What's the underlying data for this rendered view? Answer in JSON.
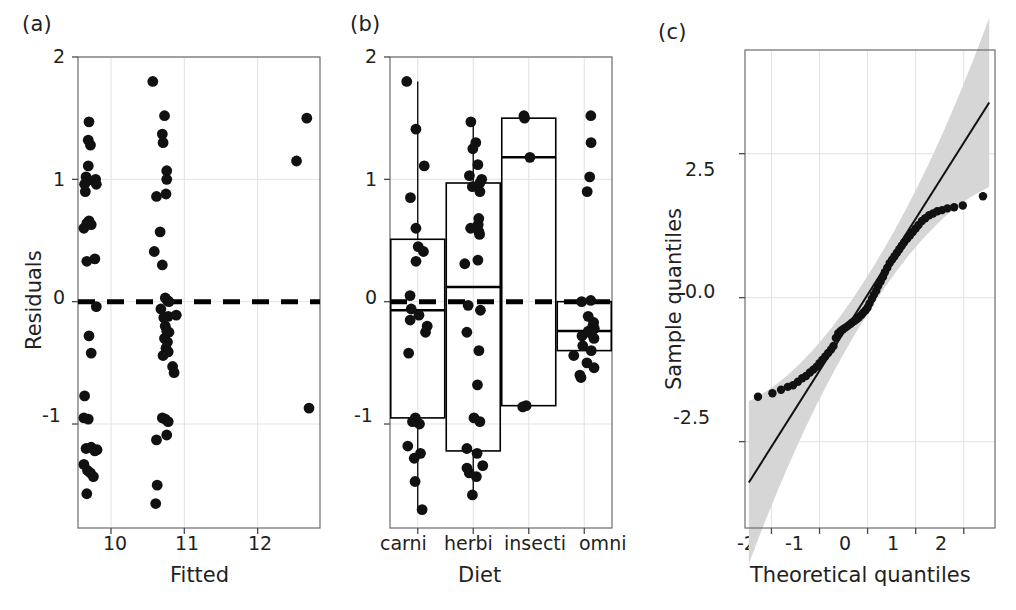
{
  "figure": {
    "panels": [
      {
        "id": "a",
        "label": "(a)"
      },
      {
        "id": "b",
        "label": "(b)"
      },
      {
        "id": "c",
        "label": "(c)"
      }
    ]
  },
  "chart_data": [
    {
      "type": "scatter",
      "panel": "(a)",
      "title": "",
      "xlabel": "Fitted",
      "ylabel": "Residuals",
      "xlim": [
        9.55,
        12.85
      ],
      "ylim": [
        -1.85,
        2.0
      ],
      "xticks": [
        10,
        11,
        12
      ],
      "xtick_labels": [
        "10",
        "11",
        "12"
      ],
      "yticks": [
        2,
        1,
        0,
        -1
      ],
      "ytick_labels": [
        "2",
        "1",
        "0",
        "-1"
      ],
      "grid": true,
      "reference_line": {
        "type": "horizontal",
        "y": 0,
        "style": "dashed"
      },
      "points": [
        {
          "x": 9.7,
          "y": 1.47
        },
        {
          "x": 9.69,
          "y": 1.32
        },
        {
          "x": 9.72,
          "y": 1.28
        },
        {
          "x": 9.69,
          "y": 1.11
        },
        {
          "x": 9.66,
          "y": 1.02
        },
        {
          "x": 9.68,
          "y": 0.99
        },
        {
          "x": 9.64,
          "y": 0.96
        },
        {
          "x": 9.79,
          "y": 1.0
        },
        {
          "x": 9.8,
          "y": 0.96
        },
        {
          "x": 9.65,
          "y": 0.9
        },
        {
          "x": 9.67,
          "y": 0.64
        },
        {
          "x": 9.7,
          "y": 0.66
        },
        {
          "x": 9.73,
          "y": 0.63
        },
        {
          "x": 9.63,
          "y": 0.6
        },
        {
          "x": 9.67,
          "y": 0.33
        },
        {
          "x": 9.78,
          "y": 0.35
        },
        {
          "x": 9.8,
          "y": -0.04
        },
        {
          "x": 9.7,
          "y": -0.28
        },
        {
          "x": 9.73,
          "y": -0.42
        },
        {
          "x": 9.64,
          "y": -0.77
        },
        {
          "x": 9.63,
          "y": -0.95
        },
        {
          "x": 9.69,
          "y": -0.96
        },
        {
          "x": 9.66,
          "y": -1.2
        },
        {
          "x": 9.73,
          "y": -1.19
        },
        {
          "x": 9.78,
          "y": -1.22
        },
        {
          "x": 9.81,
          "y": -1.21
        },
        {
          "x": 9.63,
          "y": -1.33
        },
        {
          "x": 9.68,
          "y": -1.38
        },
        {
          "x": 9.72,
          "y": -1.4
        },
        {
          "x": 9.76,
          "y": -1.43
        },
        {
          "x": 9.67,
          "y": -1.57
        },
        {
          "x": 10.57,
          "y": 1.8
        },
        {
          "x": 10.73,
          "y": 1.52
        },
        {
          "x": 10.7,
          "y": 1.37
        },
        {
          "x": 10.71,
          "y": 1.3
        },
        {
          "x": 10.76,
          "y": 1.07
        },
        {
          "x": 10.76,
          "y": 1.0
        },
        {
          "x": 10.62,
          "y": 0.86
        },
        {
          "x": 10.75,
          "y": 0.88
        },
        {
          "x": 10.67,
          "y": 0.57
        },
        {
          "x": 10.59,
          "y": 0.41
        },
        {
          "x": 10.7,
          "y": 0.3
        },
        {
          "x": 10.74,
          "y": 0.03
        },
        {
          "x": 10.77,
          "y": 0.01
        },
        {
          "x": 10.79,
          "y": 0.0
        },
        {
          "x": 10.68,
          "y": -0.06
        },
        {
          "x": 10.72,
          "y": -0.13
        },
        {
          "x": 10.78,
          "y": -0.12
        },
        {
          "x": 10.89,
          "y": -0.11
        },
        {
          "x": 10.74,
          "y": -0.2
        },
        {
          "x": 10.76,
          "y": -0.24
        },
        {
          "x": 10.79,
          "y": -0.25
        },
        {
          "x": 10.73,
          "y": -0.3
        },
        {
          "x": 10.77,
          "y": -0.33
        },
        {
          "x": 10.75,
          "y": -0.38
        },
        {
          "x": 10.78,
          "y": -0.41
        },
        {
          "x": 10.71,
          "y": -0.44
        },
        {
          "x": 10.84,
          "y": -0.53
        },
        {
          "x": 10.86,
          "y": -0.58
        },
        {
          "x": 10.7,
          "y": -0.95
        },
        {
          "x": 10.74,
          "y": -0.96
        },
        {
          "x": 10.78,
          "y": -0.98
        },
        {
          "x": 10.62,
          "y": -1.13
        },
        {
          "x": 10.76,
          "y": -1.09
        },
        {
          "x": 10.63,
          "y": -1.5
        },
        {
          "x": 10.61,
          "y": -1.65
        },
        {
          "x": 12.67,
          "y": 1.5
        },
        {
          "x": 12.53,
          "y": 1.15
        },
        {
          "x": 12.7,
          "y": -0.87
        }
      ]
    },
    {
      "type": "box",
      "panel": "(b)",
      "title": "",
      "xlabel": "Diet",
      "ylabel": "",
      "ylim": [
        -1.85,
        2.0
      ],
      "yticks": [
        2,
        1,
        0,
        -1
      ],
      "ytick_labels": [
        "2",
        "1",
        "0",
        "-1"
      ],
      "grid": true,
      "reference_line": {
        "type": "horizontal",
        "y": 0,
        "style": "dashed"
      },
      "categories": [
        "carni",
        "herbi",
        "insecti",
        "omni"
      ],
      "boxes": [
        {
          "category": "carni",
          "q1": -0.95,
          "median": -0.07,
          "q3": 0.51,
          "whisker_low": -1.7,
          "whisker_high": 1.8
        },
        {
          "category": "herbi",
          "q1": -1.22,
          "median": 0.12,
          "q3": 0.97,
          "whisker_low": -1.58,
          "whisker_high": 1.47
        },
        {
          "category": "insecti",
          "q1": -0.85,
          "median": 1.18,
          "q3": 1.5,
          "whisker_low": -0.85,
          "whisker_high": 1.5
        },
        {
          "category": "omni",
          "q1": -0.4,
          "median": -0.24,
          "q3": 0.0,
          "whisker_low": -0.4,
          "whisker_high": 0.0
        }
      ],
      "series": [
        {
          "name": "carni",
          "values": [
            1.8,
            1.41,
            1.11,
            0.85,
            0.6,
            0.45,
            0.41,
            0.33,
            0.05,
            -0.06,
            -0.11,
            -0.15,
            -0.2,
            -0.25,
            -0.42,
            -0.95,
            -0.98,
            -1.0,
            -1.18,
            -1.24,
            -1.28,
            -1.47,
            -1.7
          ]
        },
        {
          "name": "herbi",
          "values": [
            1.47,
            1.3,
            1.25,
            1.12,
            1.03,
            1.0,
            0.97,
            0.94,
            0.9,
            0.68,
            0.63,
            0.6,
            0.57,
            0.55,
            0.34,
            0.31,
            -0.03,
            -0.07,
            -0.25,
            -0.4,
            -0.68,
            -0.95,
            -0.98,
            -1.2,
            -1.24,
            -1.34,
            -1.36,
            -1.4,
            -1.43,
            -1.58
          ]
        },
        {
          "name": "insecti",
          "values": [
            1.5,
            1.52,
            1.18,
            -0.85,
            -0.86
          ]
        },
        {
          "name": "omni",
          "values": [
            1.52,
            1.3,
            1.02,
            0.9,
            0.0,
            0.01,
            -0.12,
            -0.17,
            -0.2,
            -0.22,
            -0.24,
            -0.26,
            -0.28,
            -0.3,
            -0.36,
            -0.4,
            -0.44,
            -0.5,
            -0.54,
            -0.6,
            -0.62
          ]
        }
      ]
    },
    {
      "type": "scatter",
      "panel": "(c)",
      "subtype": "qq-plot",
      "title": "",
      "xlabel": "Theoretical quantiles",
      "ylabel": "Sample quantiles",
      "xlim": [
        -2.55,
        2.65
      ],
      "ylim": [
        -4.0,
        4.3
      ],
      "xticks": [
        -2,
        -1,
        0,
        1,
        2
      ],
      "xtick_labels": [
        "-2",
        "-1",
        "0",
        "1",
        "2"
      ],
      "yticks": [
        2.5,
        0.0,
        -2.5
      ],
      "ytick_labels": [
        "2.5",
        "0.0",
        "-2.5"
      ],
      "grid": true,
      "reference_line": {
        "type": "linear",
        "slope": 1.32,
        "intercept": 0.05
      },
      "confidence_band": true,
      "points": [
        {
          "x": -2.28,
          "y": -1.72
        },
        {
          "x": -1.98,
          "y": -1.66
        },
        {
          "x": -1.8,
          "y": -1.6
        },
        {
          "x": -1.66,
          "y": -1.55
        },
        {
          "x": -1.55,
          "y": -1.52
        },
        {
          "x": -1.45,
          "y": -1.46
        },
        {
          "x": -1.36,
          "y": -1.4
        },
        {
          "x": -1.28,
          "y": -1.36
        },
        {
          "x": -1.2,
          "y": -1.3
        },
        {
          "x": -1.13,
          "y": -1.25
        },
        {
          "x": -1.06,
          "y": -1.2
        },
        {
          "x": -1.0,
          "y": -1.14
        },
        {
          "x": -0.94,
          "y": -1.08
        },
        {
          "x": -0.88,
          "y": -1.02
        },
        {
          "x": -0.82,
          "y": -0.96
        },
        {
          "x": -0.76,
          "y": -0.9
        },
        {
          "x": -0.71,
          "y": -0.84
        },
        {
          "x": -0.66,
          "y": -0.7
        },
        {
          "x": -0.61,
          "y": -0.62
        },
        {
          "x": -0.56,
          "y": -0.58
        },
        {
          "x": -0.51,
          "y": -0.55
        },
        {
          "x": -0.46,
          "y": -0.52
        },
        {
          "x": -0.41,
          "y": -0.49
        },
        {
          "x": -0.36,
          "y": -0.46
        },
        {
          "x": -0.32,
          "y": -0.43
        },
        {
          "x": -0.27,
          "y": -0.4
        },
        {
          "x": -0.22,
          "y": -0.37
        },
        {
          "x": -0.18,
          "y": -0.34
        },
        {
          "x": -0.13,
          "y": -0.3
        },
        {
          "x": -0.09,
          "y": -0.26
        },
        {
          "x": -0.04,
          "y": -0.22
        },
        {
          "x": 0.0,
          "y": -0.17
        },
        {
          "x": 0.04,
          "y": -0.1
        },
        {
          "x": 0.09,
          "y": -0.02
        },
        {
          "x": 0.13,
          "y": 0.05
        },
        {
          "x": 0.18,
          "y": 0.12
        },
        {
          "x": 0.22,
          "y": 0.2
        },
        {
          "x": 0.27,
          "y": 0.28
        },
        {
          "x": 0.32,
          "y": 0.36
        },
        {
          "x": 0.36,
          "y": 0.44
        },
        {
          "x": 0.41,
          "y": 0.52
        },
        {
          "x": 0.46,
          "y": 0.6
        },
        {
          "x": 0.51,
          "y": 0.66
        },
        {
          "x": 0.56,
          "y": 0.72
        },
        {
          "x": 0.61,
          "y": 0.78
        },
        {
          "x": 0.66,
          "y": 0.84
        },
        {
          "x": 0.71,
          "y": 0.9
        },
        {
          "x": 0.76,
          "y": 0.96
        },
        {
          "x": 0.82,
          "y": 1.02
        },
        {
          "x": 0.88,
          "y": 1.08
        },
        {
          "x": 0.94,
          "y": 1.14
        },
        {
          "x": 1.0,
          "y": 1.2
        },
        {
          "x": 1.06,
          "y": 1.26
        },
        {
          "x": 1.13,
          "y": 1.33
        },
        {
          "x": 1.2,
          "y": 1.38
        },
        {
          "x": 1.28,
          "y": 1.43
        },
        {
          "x": 1.36,
          "y": 1.46
        },
        {
          "x": 1.45,
          "y": 1.5
        },
        {
          "x": 1.55,
          "y": 1.52
        },
        {
          "x": 1.66,
          "y": 1.55
        },
        {
          "x": 1.8,
          "y": 1.57
        },
        {
          "x": 1.98,
          "y": 1.6
        },
        {
          "x": 2.4,
          "y": 1.76
        }
      ]
    }
  ]
}
